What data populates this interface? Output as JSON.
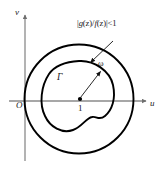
{
  "figure": {
    "kind": "complex-plane-diagram",
    "background_color": "#ffffff",
    "curve_color": "#000000",
    "axis_color": "#8a8a8a",
    "text_color": "#1a1a1a",
    "axes": {
      "vertical_label": "v",
      "horizontal_label": "u",
      "origin_label": "O"
    },
    "labels": {
      "inner_curve": "Γ",
      "point_marker": "1",
      "vector": "ω",
      "condition_full": "|g(z)/f(z)|<1",
      "condition_parts": {
        "bar_open": "|",
        "numerator_fn": "g",
        "num_arg": "(z)",
        "slash": "/",
        "denominator_fn": "f",
        "den_arg": "(z)",
        "bar_close": "|",
        "relation": "<1"
      }
    },
    "annotations": {
      "leader_arrow_from_condition": "arrow from condition label down-left to outer circle",
      "vector_arrow_from_point": "arrow from point 1 up-right to inner curve"
    }
  }
}
